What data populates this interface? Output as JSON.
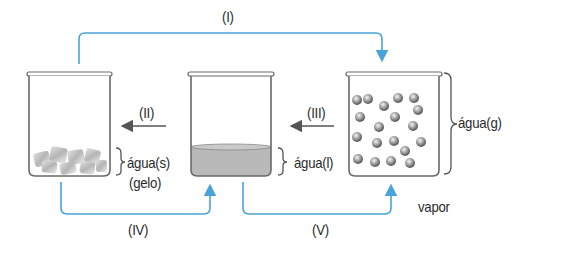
{
  "diagram": {
    "colors": {
      "transition_arrow": "#4aa3d8",
      "reverse_arrow": "#555555",
      "glass": "#6a6a6a",
      "liquid": "#b9b9b9",
      "text": "#2a2a2a"
    },
    "states": [
      {
        "id": "solid",
        "label": "água(s)",
        "sublabel": "(gelo)"
      },
      {
        "id": "liquid",
        "label": "água(l)"
      },
      {
        "id": "gas",
        "label": "água(g)",
        "sublabel": "vapor"
      }
    ],
    "transitions": [
      {
        "id": "I",
        "label": "(I)",
        "from": "solid",
        "to": "gas"
      },
      {
        "id": "II",
        "label": "(II)",
        "from": "liquid",
        "to": "solid"
      },
      {
        "id": "III",
        "label": "(III)",
        "from": "gas",
        "to": "liquid"
      },
      {
        "id": "IV",
        "label": "(IV)",
        "from": "solid",
        "to": "liquid"
      },
      {
        "id": "V",
        "label": "(V)",
        "from": "liquid",
        "to": "gas"
      }
    ]
  }
}
